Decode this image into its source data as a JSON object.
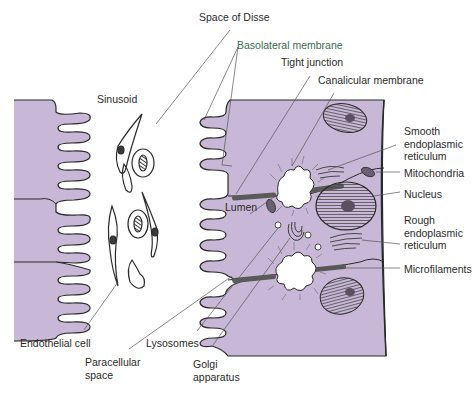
{
  "diagram": {
    "colors": {
      "cytoplasm": "#c8b7d6",
      "outline": "#2a2a2a",
      "leader_line": "#555555",
      "label_text": "#2a2a2a",
      "label_accent": "#3c6a52",
      "background": "#ffffff"
    },
    "labels": {
      "space_of_disse": "Space of Disse",
      "basolateral_membrane": "Basolateral membrane",
      "tight_junction": "Tight junction",
      "canalicular_membrane": "Canalicular membrane",
      "sinusoid": "Sinusoid",
      "smooth_er": "Smooth\nendoplasmic\nreticulum",
      "mitochondria": "Mitochondria",
      "nucleus": "Nucleus",
      "lumen": "Lumen",
      "rough_er": "Rough\nendoplasmic\nreticulum",
      "microfilaments": "Microfilaments",
      "endothelial_cell": "Endothelial cell",
      "paracellular_space": "Paracellular\nspace",
      "lysosomes": "Lysosomes",
      "golgi_apparatus": "Golgi\napparatus"
    }
  }
}
